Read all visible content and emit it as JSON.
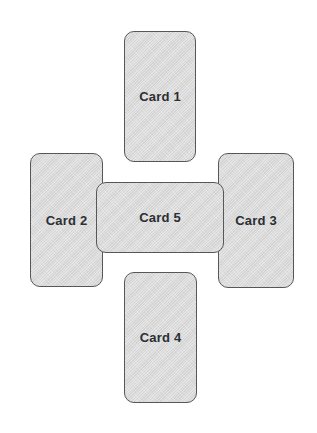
{
  "canvas": {
    "width": 317,
    "height": 433,
    "background_color": "#ffffff"
  },
  "style": {
    "card_fill_color": "#d3d3d3",
    "card_border_color": "#54585c",
    "card_text_color": "#2b2f33",
    "card_corner_radius_px": 10,
    "card_border_width_px": 1.5
  },
  "layout": {
    "arrangement": "cross",
    "description": "Five rounded rectangular cards arranged in a plus/cross pattern with a wide horizontal center card overlapping the four surrounding cards"
  },
  "cards": [
    {
      "id": "card-1",
      "label": "Card 1",
      "position": "top",
      "x": 124,
      "y": 31,
      "width": 72,
      "height": 131,
      "orientation": "portrait",
      "z": 1
    },
    {
      "id": "card-2",
      "label": "Card 2",
      "position": "left",
      "x": 30,
      "y": 153,
      "width": 73,
      "height": 134,
      "orientation": "portrait",
      "z": 1
    },
    {
      "id": "card-3",
      "label": "Card 3",
      "position": "right",
      "x": 218,
      "y": 153,
      "width": 76,
      "height": 135,
      "orientation": "portrait",
      "z": 1
    },
    {
      "id": "card-4",
      "label": "Card 4",
      "position": "bottom",
      "x": 124,
      "y": 272,
      "width": 73,
      "height": 131,
      "orientation": "portrait",
      "z": 1
    },
    {
      "id": "card-5",
      "label": "Card 5",
      "position": "center",
      "x": 96,
      "y": 182,
      "width": 128,
      "height": 71,
      "orientation": "landscape",
      "z": 5
    }
  ]
}
